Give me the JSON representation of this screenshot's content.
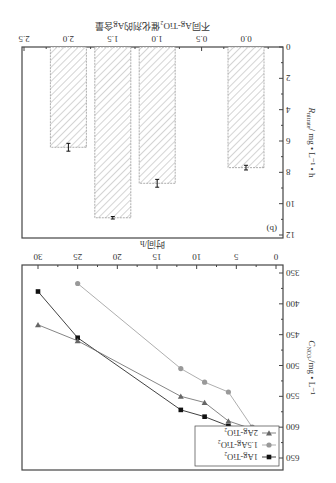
{
  "orientation": "rotated-180",
  "chart_data": [
    {
      "panel": "(a)",
      "type": "line",
      "title": "",
      "xlabel": "时间/h",
      "ylabel": "C_NO3- /mg • L-1",
      "xlim": [
        0,
        30
      ],
      "ylim": [
        350,
        670
      ],
      "xticks": [
        "0",
        "5",
        "10",
        "15",
        "20",
        "25",
        "30"
      ],
      "yticks": [
        "350",
        "400",
        "450",
        "500",
        "550",
        "600",
        "650"
      ],
      "grid": false,
      "legend_position": "lower-left (as rotated)",
      "series": [
        {
          "name": "1Ag-TiO2",
          "marker": "square",
          "color": "#111111",
          "x": [
            0,
            3,
            6,
            9,
            12,
            25,
            30
          ],
          "y": [
            657,
            603,
            598,
            583,
            572,
            455,
            380
          ]
        },
        {
          "name": "1.5Ag-TiO2",
          "marker": "circle",
          "color": "#999999",
          "x": [
            0,
            3,
            6,
            9,
            12,
            25
          ],
          "y": [
            640,
            600,
            543,
            527,
            505,
            367
          ]
        },
        {
          "name": "2Ag-TiO2",
          "marker": "triangle-down",
          "color": "#666666",
          "x": [
            0,
            3,
            6,
            9,
            12,
            25,
            30
          ],
          "y": [
            627,
            603,
            590,
            560,
            550,
            460,
            434
          ]
        }
      ]
    },
    {
      "panel": "(b)",
      "type": "bar",
      "title": "",
      "xlabel": "不同Ag-TiO2催化剂的Ag含量",
      "ylabel": "R_nitrate / mg • L-1 • h",
      "categories": [
        "0.0",
        "1.0",
        "1.5",
        "2.0"
      ],
      "values": [
        7.7,
        8.7,
        10.9,
        6.4
      ],
      "errors": [
        0.15,
        0.25,
        0.08,
        0.25
      ],
      "xticks": [
        "0.0",
        "0.5",
        "1.0",
        "1.5",
        "2.0",
        "2.5"
      ],
      "yticks": [
        "0",
        "2",
        "4",
        "6",
        "8",
        "10",
        "12"
      ],
      "ylim": [
        0,
        12
      ],
      "bar_fill": "hatched",
      "grid": false
    }
  ],
  "panel_a": {
    "label": "(a)",
    "xlabel": "时间/h",
    "ylabel_main": "C",
    "ylabel_sub": "NO3-",
    "ylabel_rest": "/mg • L⁻¹",
    "legend": [
      "1Ag-TiO₂",
      "1.5Ag-TiO₂",
      "2Ag-TiO₂"
    ]
  },
  "panel_b": {
    "label": "(b)",
    "xlabel": "不同Ag-TiO₂催化剂的Ag含量",
    "ylabel_main": "R",
    "ylabel_sub": "nitrate",
    "ylabel_rest": "/ mg • L⁻¹ • h"
  }
}
